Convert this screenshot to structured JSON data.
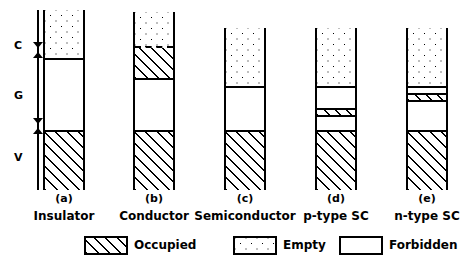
{
  "figure": {
    "ink_color": "#000000",
    "background_color": "#ffffff"
  },
  "axis": {
    "labels": [
      {
        "key": "conduction",
        "text": "C",
        "meaning": "Conduction band"
      },
      {
        "key": "gap",
        "text": "G",
        "meaning": "Forbidden gap"
      },
      {
        "key": "valence",
        "text": "V",
        "meaning": "Valence band"
      }
    ]
  },
  "columns": [
    {
      "tag": "(a)",
      "name": "Insulator",
      "bands": [
        {
          "region": "C",
          "fill": "empty",
          "label": "Empty"
        },
        {
          "region": "G",
          "fill": "forbidden",
          "label": "Forbidden"
        },
        {
          "region": "V",
          "fill": "occupied",
          "label": "Occupied"
        }
      ]
    },
    {
      "tag": "(b)",
      "name": "Conductor",
      "bands": [
        {
          "region": "C",
          "fill": "empty",
          "label": "Empty"
        },
        {
          "region": "C",
          "fill": "occupied",
          "label": "Occupied"
        },
        {
          "region": "G",
          "fill": "forbidden",
          "label": "Forbidden"
        },
        {
          "region": "V",
          "fill": "occupied",
          "label": "Occupied"
        }
      ]
    },
    {
      "tag": "(c)",
      "name": "Semiconductor",
      "bands": [
        {
          "region": "C",
          "fill": "empty",
          "label": "Empty"
        },
        {
          "region": "G",
          "fill": "forbidden",
          "label": "Forbidden"
        },
        {
          "region": "V",
          "fill": "occupied",
          "label": "Occupied"
        }
      ]
    },
    {
      "tag": "(d)",
      "name": "p-type SC",
      "bands": [
        {
          "region": "C",
          "fill": "empty",
          "label": "Empty"
        },
        {
          "region": "G",
          "fill": "forbidden",
          "label": "Forbidden"
        },
        {
          "region": "G",
          "fill": "occupied",
          "label": "Occupied acceptor level"
        },
        {
          "region": "G",
          "fill": "forbidden",
          "label": "Forbidden"
        },
        {
          "region": "V",
          "fill": "occupied",
          "label": "Occupied"
        }
      ]
    },
    {
      "tag": "(e)",
      "name": "n-type SC",
      "bands": [
        {
          "region": "C",
          "fill": "empty",
          "label": "Empty"
        },
        {
          "region": "G",
          "fill": "forbidden",
          "label": "Forbidden"
        },
        {
          "region": "G",
          "fill": "occupied",
          "label": "Occupied donor level"
        },
        {
          "region": "G",
          "fill": "forbidden",
          "label": "Forbidden"
        },
        {
          "region": "V",
          "fill": "occupied",
          "label": "Occupied"
        }
      ]
    }
  ],
  "legend": [
    {
      "key": "occupied",
      "pattern": "hatched",
      "text": "Occupied"
    },
    {
      "key": "empty",
      "pattern": "dotted",
      "text": "Empty"
    },
    {
      "key": "forbidden",
      "pattern": "blank",
      "text": "Forbidden"
    }
  ]
}
